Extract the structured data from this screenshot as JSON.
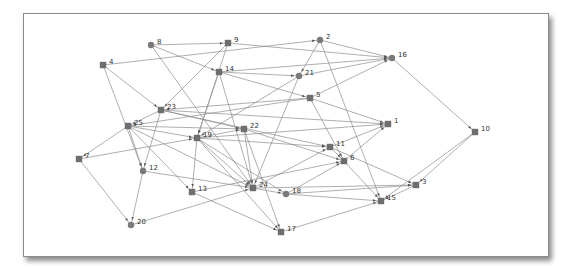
{
  "diagram": {
    "type": "network-graph",
    "colors": {
      "edge": "#8c8c8c",
      "node_square": "#6e6e6e",
      "node_circle": "#7a7a7a",
      "label": "#333333",
      "frame_border": "#8a8a8a"
    },
    "nodes": [
      {
        "id": "1",
        "label": "1",
        "shape": "square",
        "x": 388,
        "y": 124
      },
      {
        "id": "2",
        "label": "2",
        "shape": "circle",
        "x": 320,
        "y": 40
      },
      {
        "id": "3",
        "label": "3",
        "shape": "square",
        "x": 416,
        "y": 185
      },
      {
        "id": "4",
        "label": "4",
        "shape": "square",
        "x": 103,
        "y": 65
      },
      {
        "id": "5",
        "label": "5",
        "shape": "square",
        "x": 310,
        "y": 98
      },
      {
        "id": "6",
        "label": "6",
        "shape": "square",
        "x": 344,
        "y": 161
      },
      {
        "id": "7",
        "label": "7",
        "shape": "square",
        "x": 79,
        "y": 159
      },
      {
        "id": "8",
        "label": "8",
        "shape": "circle",
        "x": 151,
        "y": 45
      },
      {
        "id": "9",
        "label": "9",
        "shape": "square",
        "x": 228,
        "y": 43
      },
      {
        "id": "10",
        "label": "10",
        "shape": "square",
        "x": 475,
        "y": 132
      },
      {
        "id": "11",
        "label": "11",
        "shape": "square",
        "x": 330,
        "y": 147
      },
      {
        "id": "12",
        "label": "12",
        "shape": "circle",
        "x": 143,
        "y": 171
      },
      {
        "id": "13",
        "label": "13",
        "shape": "square",
        "x": 192,
        "y": 192
      },
      {
        "id": "14",
        "label": "14",
        "shape": "square",
        "x": 219,
        "y": 72
      },
      {
        "id": "15",
        "label": "15",
        "shape": "square",
        "x": 381,
        "y": 201
      },
      {
        "id": "16",
        "label": "16",
        "shape": "circle",
        "x": 392,
        "y": 58
      },
      {
        "id": "17",
        "label": "17",
        "shape": "square",
        "x": 281,
        "y": 232
      },
      {
        "id": "18",
        "label": "18",
        "shape": "circle",
        "x": 286,
        "y": 194
      },
      {
        "id": "19",
        "label": "19",
        "shape": "square",
        "x": 197,
        "y": 138
      },
      {
        "id": "20",
        "label": "20",
        "shape": "circle",
        "x": 131,
        "y": 225
      },
      {
        "id": "21",
        "label": "21",
        "shape": "circle",
        "x": 299,
        "y": 76
      },
      {
        "id": "22",
        "label": "22",
        "shape": "square",
        "x": 244,
        "y": 129
      },
      {
        "id": "23",
        "label": "23",
        "shape": "square",
        "x": 161,
        "y": 110
      },
      {
        "id": "24",
        "label": "24",
        "shape": "square",
        "x": 253,
        "y": 188
      },
      {
        "id": "25",
        "label": "25",
        "shape": "square",
        "x": 128,
        "y": 126
      }
    ],
    "edges": [
      [
        "8",
        "9"
      ],
      [
        "8",
        "14"
      ],
      [
        "8",
        "24"
      ],
      [
        "9",
        "23"
      ],
      [
        "9",
        "16"
      ],
      [
        "9",
        "19"
      ],
      [
        "4",
        "2"
      ],
      [
        "4",
        "23"
      ],
      [
        "4",
        "12"
      ],
      [
        "2",
        "16"
      ],
      [
        "2",
        "21"
      ],
      [
        "2",
        "15"
      ],
      [
        "14",
        "16"
      ],
      [
        "14",
        "21"
      ],
      [
        "14",
        "5"
      ],
      [
        "14",
        "19"
      ],
      [
        "14",
        "24"
      ],
      [
        "21",
        "16"
      ],
      [
        "21",
        "19"
      ],
      [
        "21",
        "24"
      ],
      [
        "5",
        "16"
      ],
      [
        "5",
        "23"
      ],
      [
        "5",
        "25"
      ],
      [
        "5",
        "1"
      ],
      [
        "5",
        "6"
      ],
      [
        "23",
        "25"
      ],
      [
        "23",
        "22"
      ],
      [
        "23",
        "11"
      ],
      [
        "23",
        "12"
      ],
      [
        "23",
        "1"
      ],
      [
        "25",
        "7"
      ],
      [
        "25",
        "12"
      ],
      [
        "25",
        "19"
      ],
      [
        "25",
        "22"
      ],
      [
        "25",
        "13"
      ],
      [
        "25",
        "24"
      ],
      [
        "19",
        "22"
      ],
      [
        "19",
        "11"
      ],
      [
        "19",
        "13"
      ],
      [
        "19",
        "24"
      ],
      [
        "19",
        "17"
      ],
      [
        "19",
        "18"
      ],
      [
        "19",
        "1"
      ],
      [
        "22",
        "24"
      ],
      [
        "22",
        "17"
      ],
      [
        "22",
        "6"
      ],
      [
        "7",
        "19"
      ],
      [
        "7",
        "20"
      ],
      [
        "12",
        "24"
      ],
      [
        "12",
        "20"
      ],
      [
        "13",
        "17"
      ],
      [
        "13",
        "6"
      ],
      [
        "20",
        "24"
      ],
      [
        "24",
        "18"
      ],
      [
        "24",
        "11"
      ],
      [
        "24",
        "3"
      ],
      [
        "18",
        "15"
      ],
      [
        "18",
        "6"
      ],
      [
        "18",
        "3"
      ],
      [
        "11",
        "1"
      ],
      [
        "11",
        "3"
      ],
      [
        "11",
        "6"
      ],
      [
        "6",
        "1"
      ],
      [
        "6",
        "15"
      ],
      [
        "16",
        "10"
      ],
      [
        "10",
        "3"
      ],
      [
        "10",
        "15"
      ],
      [
        "3",
        "15"
      ],
      [
        "17",
        "15"
      ]
    ]
  }
}
